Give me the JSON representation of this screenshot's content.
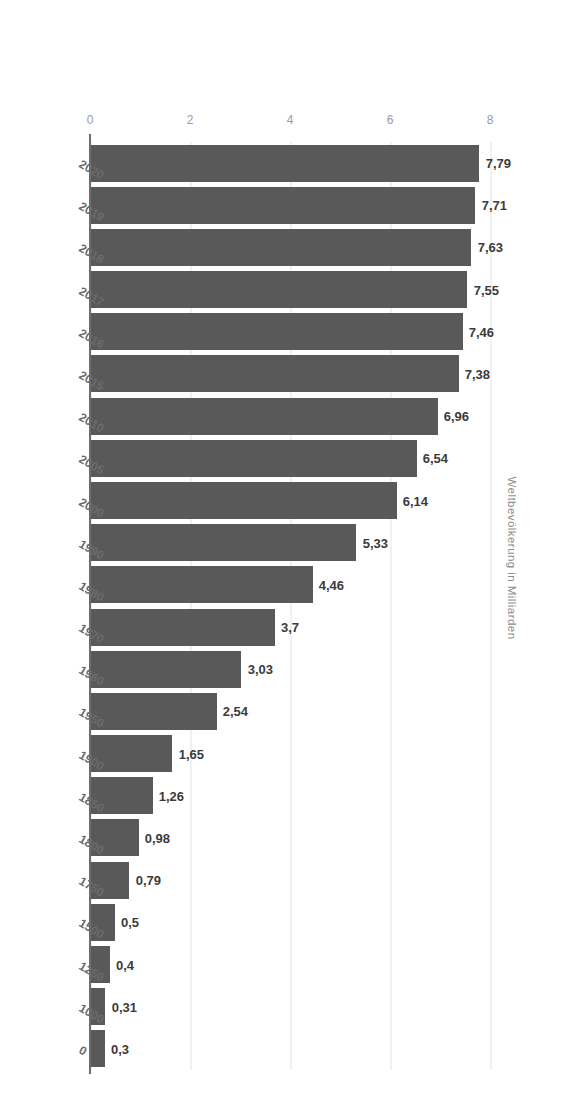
{
  "chart_data": {
    "type": "bar",
    "orientation": "horizontal",
    "title": "",
    "subtitle": "",
    "xlabel": "Weltbevölkerung in Milliarden",
    "ylabel": "",
    "value_axis_label": "Weltbevölkerung in Milliarden",
    "value_axis_ticks": [
      "0",
      "2",
      "4",
      "6",
      "8"
    ],
    "value_axis_tick_values": [
      0,
      2,
      4,
      6,
      8
    ],
    "xlim": [
      0,
      8
    ],
    "grid": true,
    "gridlines_at": [
      0,
      2,
      4,
      6,
      8
    ],
    "legend": null,
    "legend_position": "none",
    "decimal_separator": ",",
    "categories": [
      "0",
      "1000",
      "1250",
      "1500",
      "1750",
      "1800",
      "1850",
      "1900",
      "1950",
      "1960",
      "1970",
      "1980",
      "1990",
      "2000",
      "2005",
      "2010",
      "2015",
      "2016",
      "2017",
      "2018",
      "2019",
      "2020"
    ],
    "values": [
      0.3,
      0.31,
      0.4,
      0.5,
      0.79,
      0.98,
      1.26,
      1.65,
      2.54,
      3.03,
      3.7,
      4.46,
      5.33,
      6.14,
      6.54,
      6.96,
      7.38,
      7.46,
      7.55,
      7.63,
      7.71,
      7.79
    ],
    "value_labels": [
      "0,3",
      "0,31",
      "0,4",
      "0,5",
      "0,79",
      "0,98",
      "1,26",
      "1,65",
      "2,54",
      "3,03",
      "3,7",
      "4,46",
      "5,33",
      "6,14",
      "6,54",
      "6,96",
      "7,38",
      "7,46",
      "7,55",
      "7,63",
      "7,71",
      "7,79"
    ],
    "series": [
      {
        "name": "Weltbevölkerung",
        "color": "#595959",
        "values": [
          0.3,
          0.31,
          0.4,
          0.5,
          0.79,
          0.98,
          1.26,
          1.65,
          2.54,
          3.03,
          3.7,
          4.46,
          5.33,
          6.14,
          6.54,
          6.96,
          7.38,
          7.46,
          7.55,
          7.63,
          7.71,
          7.79
        ]
      }
    ]
  },
  "colors": {
    "bar": "#595959",
    "background": "#ffffff",
    "gridline": "#e4e4e4",
    "axis_line": "#6d6d6d",
    "value_label_text": "#3b3b3b",
    "category_label_text": "#6b6b6b",
    "tick_text": "#9a9a9a",
    "axis_title_text": "#8d8d8d"
  }
}
